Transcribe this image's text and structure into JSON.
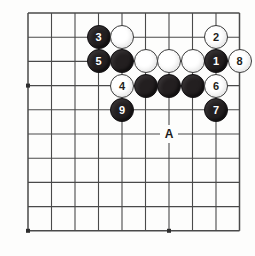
{
  "board": {
    "title": "Go board position diagram",
    "grid": {
      "cols": 10,
      "rows": 10,
      "origin_x": 28,
      "origin_y": 13,
      "spacing_x": 23.5,
      "spacing_y": 24.2,
      "line_color": "#4a4a4a",
      "background_color": "#fdfdfc"
    },
    "star_points": [
      {
        "col": 0,
        "row": 3
      },
      {
        "col": 0,
        "row": 9
      },
      {
        "col": 6,
        "row": 9
      }
    ],
    "stone_colors": {
      "black": "#231f20",
      "white": "#ffffff",
      "black_label": "#ffffff",
      "white_label": "#231f20"
    },
    "stones": [
      {
        "col": 3,
        "row": 1,
        "color": "black",
        "label": "3"
      },
      {
        "col": 4,
        "row": 1,
        "color": "white",
        "label": ""
      },
      {
        "col": 8,
        "row": 1,
        "color": "white",
        "label": "2"
      },
      {
        "col": 3,
        "row": 2,
        "color": "black",
        "label": "5"
      },
      {
        "col": 4,
        "row": 2,
        "color": "black",
        "label": ""
      },
      {
        "col": 5,
        "row": 2,
        "color": "white",
        "label": ""
      },
      {
        "col": 6,
        "row": 2,
        "color": "white",
        "label": ""
      },
      {
        "col": 7,
        "row": 2,
        "color": "white",
        "label": ""
      },
      {
        "col": 8,
        "row": 2,
        "color": "black",
        "label": "1"
      },
      {
        "col": 9,
        "row": 2,
        "color": "white",
        "label": "8"
      },
      {
        "col": 4,
        "row": 3,
        "color": "white",
        "label": "4"
      },
      {
        "col": 5,
        "row": 3,
        "color": "black",
        "label": ""
      },
      {
        "col": 6,
        "row": 3,
        "color": "black",
        "label": ""
      },
      {
        "col": 7,
        "row": 3,
        "color": "black",
        "label": ""
      },
      {
        "col": 8,
        "row": 3,
        "color": "white",
        "label": "6"
      },
      {
        "col": 4,
        "row": 4,
        "color": "black",
        "label": "9"
      },
      {
        "col": 8,
        "row": 4,
        "color": "black",
        "label": "7"
      }
    ],
    "markers": [
      {
        "col": 6,
        "row": 5,
        "label": "A"
      }
    ]
  }
}
